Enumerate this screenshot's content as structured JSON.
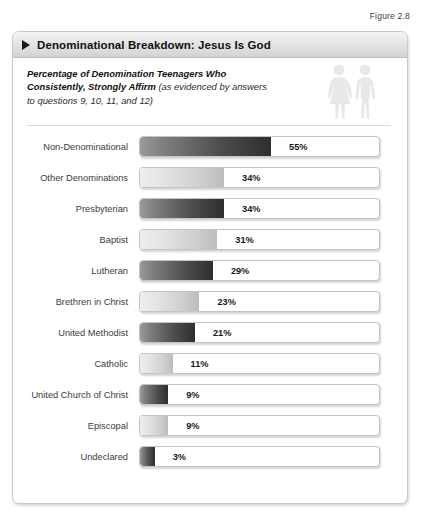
{
  "figure": {
    "caption": "Figure 2.8",
    "title": "Denominational Breakdown: Jesus Is God",
    "subtitle_strong": "Percentage of Denomination Teenagers Who Consistently, Strongly Affirm ",
    "subtitle_light": "(as evidenced by answers to questions 9, 10, 11, and 12)",
    "icons": [
      "female-figure-icon",
      "male-figure-icon"
    ]
  },
  "chart_data": {
    "type": "bar",
    "orientation": "horizontal",
    "title": "Denominational Breakdown: Jesus Is God",
    "subtitle": "Percentage of Denomination Teenagers Who Consistently, Strongly Affirm (as evidenced by answers to questions 9, 10, 11, and 12)",
    "xlabel": "",
    "ylabel": "",
    "xlim": [
      0,
      100
    ],
    "unit": "%",
    "grid": false,
    "legend": "none",
    "categories": [
      "Non-Denominational",
      "Other Denominations",
      "Presbyterian",
      "Baptist",
      "Lutheran",
      "Brethren in Christ",
      "United Methodist",
      "Catholic",
      "United Church of Christ",
      "Episcopal",
      "Undeclared"
    ],
    "values": [
      55,
      34,
      34,
      31,
      29,
      23,
      21,
      11,
      9,
      9,
      3
    ],
    "value_labels": [
      "55%",
      "34%",
      "34%",
      "31%",
      "29%",
      "23%",
      "21%",
      "11%",
      "9%",
      "9%",
      "3%"
    ],
    "bar_styles": [
      "dark",
      "light",
      "dark",
      "light",
      "dark",
      "light",
      "dark",
      "light",
      "dark",
      "light",
      "dark"
    ],
    "colors": {
      "dark_start": "#9a9a9a",
      "dark_end": "#2e2e2e",
      "light_start": "#eeeeee",
      "light_end": "#bcbcbc",
      "track": "#ffffff",
      "track_border": "#c4c4c4",
      "title_band": "#e2e2e2",
      "label_text": "#3b3b3b"
    }
  }
}
